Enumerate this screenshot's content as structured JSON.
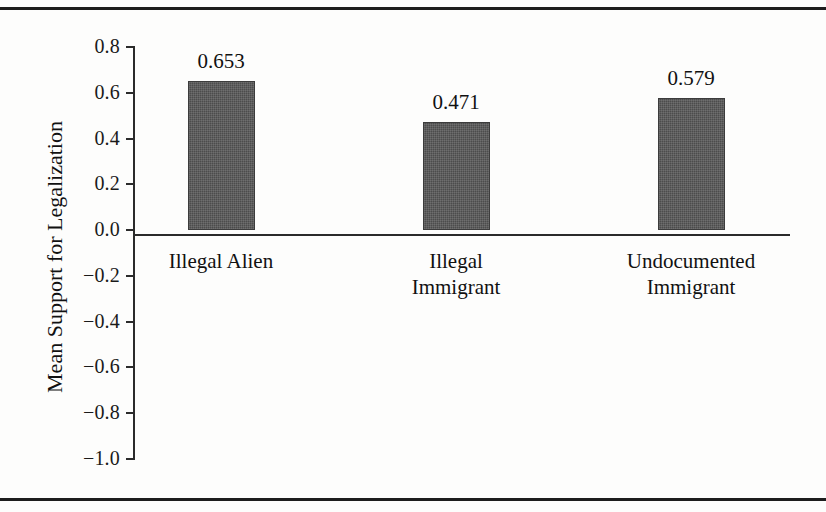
{
  "chart_data": {
    "type": "bar",
    "title": "",
    "xlabel": "",
    "ylabel": "Mean Support for Legalization",
    "categories": [
      "Illegal Alien",
      "Illegal Immigrant",
      "Undocumented Immigrant"
    ],
    "values": [
      0.653,
      0.471,
      0.579
    ],
    "value_labels": [
      "0.653",
      "0.471",
      "0.579"
    ],
    "ylim": [
      -1.0,
      0.8
    ],
    "ytick_values": [
      0.8,
      0.6,
      0.4,
      0.2,
      0.0,
      -0.2,
      -0.4,
      -0.6,
      -0.8,
      -1.0
    ],
    "ytick_labels": [
      "0.8",
      "0.6",
      "0.4",
      "0.2",
      "0.0",
      "−0.2",
      "−0.4",
      "−0.6",
      "−0.8",
      "−1.0"
    ],
    "grid": false,
    "legend": false,
    "bar_color": "#4c4c4c",
    "axis_color": "#2b2b2b",
    "background_color": "#fdfdfc"
  },
  "category_lines": [
    [
      "Illegal Alien"
    ],
    [
      "Illegal",
      "Immigrant"
    ],
    [
      "Undocumented",
      "Immigrant"
    ]
  ],
  "figure": {
    "rule_color": "#1d1d1d"
  }
}
